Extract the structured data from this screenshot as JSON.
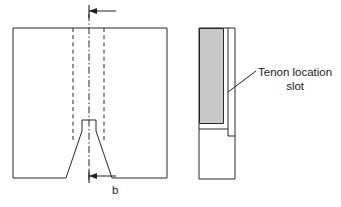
{
  "drawing": {
    "title": "Tenon location slot engineering drawing",
    "background_color": "#ffffff",
    "line_color": "#262626",
    "fill_gray": "#c8c8c8",
    "views": [
      {
        "name": "front-elevation",
        "description": "Front view of timber member with V chamfer and central tenon tab",
        "outline": {
          "x": 13,
          "y": 28,
          "width": 154,
          "height": 150
        },
        "tenon_tab": {
          "x": 82,
          "y": 120,
          "width": 14,
          "height": 11
        },
        "hidden_lines_x": [
          73,
          104
        ],
        "centerline_x": 89
      },
      {
        "name": "side-elevation",
        "description": "Side view showing shaded tenon block and location slot",
        "outline": {
          "x": 199,
          "y": 28,
          "width": 36,
          "height": 151
        },
        "shaded_block": {
          "x": 200,
          "y": 29,
          "width": 24,
          "height": 95
        },
        "slot_bottom_y": 136
      }
    ]
  },
  "annotations": {
    "tenon_slot_label_line1": "Tenon location",
    "tenon_slot_label_line2": "slot",
    "leader_start": {
      "x": 228,
      "y": 92
    },
    "leader_end": {
      "x": 256,
      "y": 71
    }
  },
  "dimensions": {
    "width_symbol": "b",
    "top_arrow": {
      "tip_x": 89,
      "tail_x": 116,
      "y": 11
    },
    "bottom_arrow": {
      "tip_x": 89,
      "tail_x": 116,
      "y": 176
    }
  }
}
